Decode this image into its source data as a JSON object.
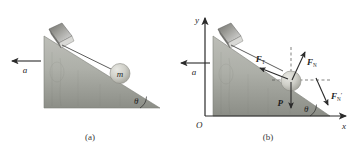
{
  "figure": {
    "type": "physics-free-body-diagram",
    "background_color": "#ffffff",
    "ink_color": "#2b2b2b",
    "incline_fill_top": "#b9bab4",
    "incline_fill_bottom": "#8e9089",
    "ball_color": "#c9c9c2",
    "block_color": "#8a8a86"
  },
  "panels": [
    {
      "id": "a",
      "caption": "(a)",
      "labels": {
        "acceleration": "a",
        "mass": "m",
        "angle": "θ"
      }
    },
    {
      "id": "b",
      "caption": "(b)",
      "labels": {
        "acceleration": "a",
        "origin": "O",
        "axis_x": "x",
        "axis_y": "y",
        "angle": "θ",
        "force_tension": "F",
        "force_tension_sub": "T",
        "force_normal": "F",
        "force_normal_sub": "N",
        "force_normal_reaction": "F",
        "force_normal_reaction_prime": "′",
        "force_normal_reaction_sub": "N",
        "force_gravity": "P"
      }
    }
  ],
  "vectors": [
    {
      "name": "acceleration-a-panel-a",
      "label": "a",
      "direction": "left"
    },
    {
      "name": "acceleration-a-panel-b",
      "label": "a",
      "direction": "left"
    },
    {
      "name": "tension-FT",
      "label": "F_T",
      "direction": "down-left along incline"
    },
    {
      "name": "normal-FN",
      "label": "F_N",
      "direction": "up-right perpendicular to incline"
    },
    {
      "name": "normal-reaction-FN-prime",
      "label": "F'_N",
      "direction": "down-right perpendicular to incline"
    },
    {
      "name": "gravity-P",
      "label": "P",
      "direction": "down"
    }
  ]
}
